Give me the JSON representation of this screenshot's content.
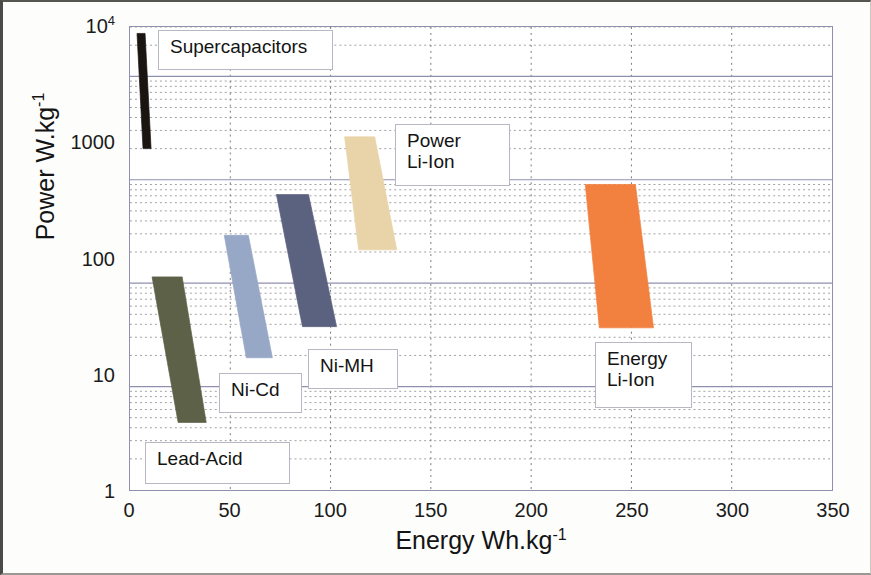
{
  "figure": {
    "title": "",
    "background": "#fdfdfc"
  },
  "axes": {
    "x": {
      "label_main": "Energy Wh.kg",
      "label_exponent": "-1",
      "ticks": [
        "0",
        "50",
        "100",
        "150",
        "200",
        "250",
        "300",
        "350"
      ],
      "tick_values": [
        0,
        50,
        100,
        150,
        200,
        250,
        300,
        350
      ],
      "min": 0,
      "max": 350,
      "scale": "linear"
    },
    "y": {
      "label_main": "Power W.kg",
      "label_exponent": "-1",
      "ticks": [
        "1",
        "10",
        "100",
        "1000",
        "10"
      ],
      "top_tick_base": "10",
      "top_tick_exponent": "4",
      "tick_values": [
        1,
        10,
        100,
        1000,
        10000
      ],
      "min": 1,
      "max": 30000,
      "scale": "log"
    },
    "grid": {
      "major_color": "#8f8fb0",
      "minor_color": "#9a9a9a",
      "minor_style": "dotted",
      "x_major_style": "dotted"
    }
  },
  "chart_data": {
    "type": "area",
    "xlabel": "Energy Wh.kg-1",
    "ylabel": "Power W.kg-1",
    "xlim": [
      0,
      350
    ],
    "ylim": [
      1,
      30000
    ],
    "yscale": "log",
    "xscale": "linear",
    "grid": true,
    "legend": "inline-callouts",
    "series": [
      {
        "name": "Supercapacitors",
        "color": "#1a1511",
        "energy_range_wh_kg": [
          2,
          10
        ],
        "power_range_w_kg": [
          2000,
          25000
        ],
        "polygon": [
          {
            "energy": 3.5,
            "power": 26000
          },
          {
            "energy": 7.5,
            "power": 26000
          },
          {
            "energy": 10.5,
            "power": 2000
          },
          {
            "energy": 6.5,
            "power": 2000
          }
        ],
        "label": "Supercapacitors"
      },
      {
        "name": "Lead-Acid",
        "color": "#5d6147",
        "energy_range_wh_kg": [
          10,
          40
        ],
        "power_range_w_kg": [
          4.5,
          115
        ],
        "polygon": [
          {
            "energy": 11,
            "power": 115
          },
          {
            "energy": 26,
            "power": 115
          },
          {
            "energy": 38,
            "power": 4.5
          },
          {
            "energy": 24,
            "power": 4.5
          }
        ],
        "label": "Lead-Acid"
      },
      {
        "name": "Ni-Cd",
        "color": "#97a7c6",
        "energy_range_wh_kg": [
          45,
          72
        ],
        "power_range_w_kg": [
          19,
          290
        ],
        "polygon": [
          {
            "energy": 47,
            "power": 290
          },
          {
            "energy": 59,
            "power": 290
          },
          {
            "energy": 71,
            "power": 19
          },
          {
            "energy": 58,
            "power": 19
          }
        ],
        "label": "Ni-Cd"
      },
      {
        "name": "Ni-MH",
        "color": "#5b627f",
        "energy_range_wh_kg": [
          70,
          105
        ],
        "power_range_w_kg": [
          38,
          720
        ],
        "polygon": [
          {
            "energy": 73,
            "power": 720
          },
          {
            "energy": 89,
            "power": 720
          },
          {
            "energy": 103,
            "power": 38
          },
          {
            "energy": 86,
            "power": 38
          }
        ],
        "label": "Ni-MH"
      },
      {
        "name": "Power Li-Ion",
        "color": "#e9d4a9",
        "energy_range_wh_kg": [
          105,
          135
        ],
        "power_range_w_kg": [
          210,
          2600
        ],
        "polygon": [
          {
            "energy": 107,
            "power": 2600
          },
          {
            "energy": 122,
            "power": 2600
          },
          {
            "energy": 133,
            "power": 210
          },
          {
            "energy": 114,
            "power": 210
          }
        ],
        "label": "Power\nLi-Ion"
      },
      {
        "name": "Energy Li-Ion",
        "color": "#f2813f",
        "energy_range_wh_kg": [
          225,
          262
        ],
        "power_range_w_kg": [
          37,
          900
        ],
        "polygon": [
          {
            "energy": 227,
            "power": 900
          },
          {
            "energy": 252,
            "power": 900
          },
          {
            "energy": 261,
            "power": 37
          },
          {
            "energy": 234,
            "power": 37
          }
        ],
        "label": "Energy\nLi-Ion"
      }
    ]
  },
  "callouts": [
    {
      "id": "supercapacitors",
      "text": "Supercapacitors",
      "x": 155,
      "y": 28,
      "w": 175,
      "h": 40
    },
    {
      "id": "power-li-ion",
      "text": "Power\nLi-Ion",
      "x": 392,
      "y": 122,
      "w": 115,
      "h": 62
    },
    {
      "id": "ni-mh",
      "text": "Ni-MH",
      "x": 305,
      "y": 347,
      "w": 90,
      "h": 40
    },
    {
      "id": "ni-cd",
      "text": "Ni-Cd",
      "x": 216,
      "y": 371,
      "w": 83,
      "h": 40
    },
    {
      "id": "lead-acid",
      "text": "Lead-Acid",
      "x": 142,
      "y": 440,
      "w": 145,
      "h": 42
    },
    {
      "id": "energy-li-ion",
      "text": "Energy\nLi-Ion",
      "x": 592,
      "y": 340,
      "w": 97,
      "h": 66
    }
  ]
}
